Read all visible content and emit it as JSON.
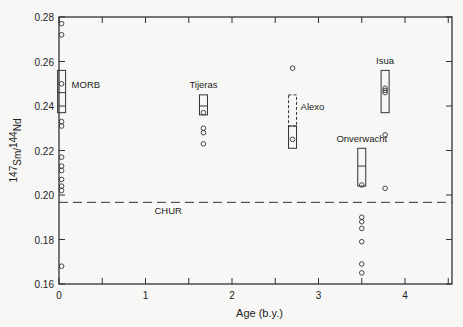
{
  "chart_data": {
    "type": "scatter",
    "title": "",
    "xlabel": "Age (b.y.)",
    "ylabel": "147Sm/144Nd",
    "ylabel_parts": {
      "sup1": "147",
      "main1": "Sm/",
      "sup2": "144",
      "main2": "Nd"
    },
    "xlim": [
      0,
      4.55
    ],
    "ylim": [
      0.16,
      0.28
    ],
    "x_ticks": [
      0,
      1,
      2,
      3,
      4
    ],
    "x_tick_labels": [
      "0",
      "1",
      "2",
      "3",
      "4"
    ],
    "x_minor_ticks": [
      0.5,
      1.5,
      2.5,
      3.5,
      4.5
    ],
    "y_ticks": [
      0.16,
      0.18,
      0.2,
      0.22,
      0.24,
      0.26,
      0.28
    ],
    "y_tick_labels": [
      "0.16",
      "0.18",
      "0.20",
      "0.22",
      "0.24",
      "0.26",
      "0.28"
    ],
    "grid": false,
    "reference_line": {
      "name": "CHUR",
      "y": 0.1967,
      "style": "dashed",
      "label_x": 1.45
    },
    "series": [
      {
        "name": "MORB",
        "age": 0.03,
        "label_pos": [
          0.3,
          0.25
        ],
        "points": [
          0.277,
          0.272,
          0.25,
          0.233,
          0.231,
          0.217,
          0.213,
          0.211,
          0.207,
          0.204,
          0.202,
          0.168
        ],
        "box": {
          "low": 0.237,
          "high": 0.256,
          "mid": 0.246,
          "style": "solid"
        }
      },
      {
        "name": "Tijeras",
        "age": 1.67,
        "label_pos": [
          1.67,
          0.25
        ],
        "points": [
          0.237,
          0.23,
          0.228,
          0.223
        ],
        "box": {
          "low": 0.236,
          "high": 0.245,
          "mid": 0.24,
          "style": "solid"
        }
      },
      {
        "name": "Alexo",
        "age": 2.7,
        "label_pos": [
          2.95,
          0.24
        ],
        "points": [
          0.257,
          0.225
        ],
        "box": {
          "low": 0.221,
          "high": 0.231,
          "style": "solid"
        },
        "dashed_box": {
          "low": 0.231,
          "high": 0.245
        }
      },
      {
        "name": "Onverwacht",
        "age": 3.5,
        "label_pos": [
          3.5,
          0.2255
        ],
        "points": [
          0.2045,
          0.19,
          0.188,
          0.185,
          0.179,
          0.169,
          0.165
        ],
        "box": {
          "low": 0.204,
          "high": 0.221,
          "mid": 0.213,
          "style": "solid"
        }
      },
      {
        "name": "Isua",
        "age": 3.77,
        "label_pos": [
          3.77,
          0.2605
        ],
        "points": [
          0.248,
          0.247,
          0.246,
          0.227,
          0.203
        ],
        "box": {
          "low": 0.237,
          "high": 0.256,
          "style": "solid"
        }
      }
    ]
  }
}
